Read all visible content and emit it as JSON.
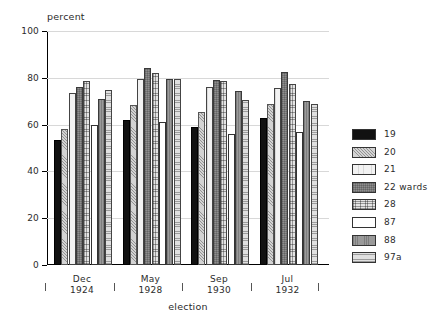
{
  "chart_data": {
    "type": "bar",
    "title": "",
    "subtitle": "",
    "xlabel": "election",
    "ylabel": "percent",
    "categories": [
      "Dec 1924",
      "May 1928",
      "Sep 1930",
      "Jul 1932"
    ],
    "category_lines": [
      [
        "Dec",
        "1924"
      ],
      [
        "May",
        "1928"
      ],
      [
        "Sep",
        "1930"
      ],
      [
        "Jul",
        "1932"
      ]
    ],
    "ylim": [
      0,
      100
    ],
    "yticks": [
      0,
      20,
      40,
      60,
      80,
      100
    ],
    "ytick_labels": [
      "0",
      "20",
      "40",
      "60",
      "80",
      "100"
    ],
    "grid": true,
    "grid_axis": "y",
    "legend_position": "right",
    "series": [
      {
        "name": "19",
        "pattern": "solid-black",
        "color": "#111111",
        "values": [
          53.5,
          62.0,
          59.0,
          63.0
        ]
      },
      {
        "name": "20",
        "pattern": "light-stipple",
        "color": "#d3d3d3",
        "values": [
          58.0,
          68.5,
          65.5,
          69.0
        ]
      },
      {
        "name": "21",
        "pattern": "very-light",
        "color": "#f2f2f2",
        "values": [
          73.5,
          79.5,
          76.0,
          75.5
        ]
      },
      {
        "name": "22 wards",
        "pattern": "mid-grey-grid",
        "color": "#8e8e8e",
        "values": [
          76.0,
          84.0,
          79.0,
          82.5
        ]
      },
      {
        "name": "28",
        "pattern": "cross-hatch",
        "color": "#e4e4e4",
        "values": [
          78.5,
          82.0,
          78.5,
          77.5
        ]
      },
      {
        "name": "87",
        "pattern": "white",
        "color": "#ffffff",
        "values": [
          60.0,
          61.0,
          56.0,
          57.0
        ]
      },
      {
        "name": "88",
        "pattern": "grey-vertical",
        "color": "#9a9a9a",
        "values": [
          71.0,
          79.5,
          74.5,
          70.0
        ]
      },
      {
        "name": "97a",
        "pattern": "light-horizontal",
        "color": "#e0e0e0",
        "values": [
          75.0,
          79.5,
          70.5,
          69.0
        ]
      }
    ]
  },
  "legend": {
    "items": [
      {
        "label": "19"
      },
      {
        "label": "20"
      },
      {
        "label": "21"
      },
      {
        "label": "22 wards"
      },
      {
        "label": "28"
      },
      {
        "label": "87"
      },
      {
        "label": "88"
      },
      {
        "label": "97a"
      }
    ]
  }
}
